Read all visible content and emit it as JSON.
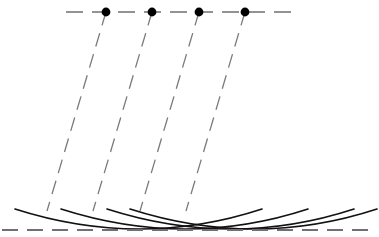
{
  "figure": {
    "width": 379,
    "height": 237,
    "background_color": "#ffffff"
  },
  "colors": {
    "dashed_line": "#707070",
    "dashed_ray": "#7a7a7a",
    "arc_stroke": "#111111",
    "point_marker": "#000000"
  },
  "chart_data": {
    "type": "line",
    "xlabel": "",
    "ylabel": "",
    "xlim": [
      0,
      379
    ],
    "ylim": [
      0,
      237
    ],
    "grid": false,
    "legend": "none",
    "series": [
      {
        "name": "incident-wavefront-line",
        "style": "dashed",
        "x": [
          66,
          292
        ],
        "y": [
          12,
          12
        ]
      },
      {
        "name": "refracted-wavefront-line",
        "style": "dashed",
        "x": [
          2,
          377
        ],
        "y": [
          230,
          230
        ]
      },
      {
        "name": "ray-1",
        "style": "dashed",
        "x": [
          106,
          47
        ],
        "y": [
          12,
          211
        ]
      },
      {
        "name": "ray-2",
        "style": "dashed",
        "x": [
          152,
          93
        ],
        "y": [
          12,
          211
        ]
      },
      {
        "name": "ray-3",
        "style": "dashed",
        "x": [
          199,
          140
        ],
        "y": [
          12,
          211
        ]
      },
      {
        "name": "ray-4",
        "style": "dashed",
        "x": [
          245,
          186
        ],
        "y": [
          12,
          211
        ]
      },
      {
        "name": "wavelet-arc-1",
        "style": "solid",
        "vertex": [
          140,
          229
        ],
        "x_start": 15,
        "x_end": 262,
        "y_start": 209,
        "y_end": 209
      },
      {
        "name": "wavelet-arc-2",
        "style": "solid",
        "vertex": [
          186,
          229
        ],
        "x_start": 61,
        "x_end": 308,
        "y_start": 209,
        "y_end": 209
      },
      {
        "name": "wavelet-arc-3",
        "style": "solid",
        "vertex": [
          232,
          229
        ],
        "x_start": 107,
        "x_end": 354,
        "y_start": 209,
        "y_end": 209
      },
      {
        "name": "wavelet-arc-4",
        "style": "solid",
        "vertex": [
          255,
          229
        ],
        "x_start": 130,
        "x_end": 377,
        "y_start": 209,
        "y_end": 209
      }
    ],
    "points": [
      {
        "name": "source-point-1",
        "x": 106,
        "y": 12
      },
      {
        "name": "source-point-2",
        "x": 152,
        "y": 12
      },
      {
        "name": "source-point-3",
        "x": 199,
        "y": 12
      },
      {
        "name": "source-point-4",
        "x": 245,
        "y": 12
      }
    ],
    "annotations": []
  }
}
